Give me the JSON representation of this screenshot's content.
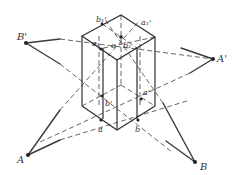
{
  "diagram": {
    "type": "geometry-projection",
    "labels": {
      "B_prime": "B'",
      "A_prime": "A'",
      "A": "A",
      "B": "B",
      "b1_prime": "b₁'",
      "a1_prime": "a₁'",
      "a1": "a₁",
      "o": "o",
      "b1": "b₁",
      "b_prime": "b'",
      "a_prime": "a'",
      "a": "a",
      "b": "b"
    },
    "colors": {
      "line": "#3a3a3a",
      "background": "#ffffff"
    }
  }
}
